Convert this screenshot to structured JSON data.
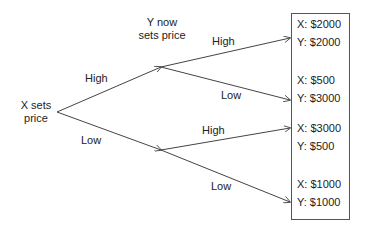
{
  "diagram": {
    "type": "game-tree",
    "root": {
      "label_line1": "X sets",
      "label_line2": "price"
    },
    "second_mover": {
      "label_line1": "Y now",
      "label_line2": "sets price"
    },
    "x_branches": [
      {
        "label": "High"
      },
      {
        "label": "Low"
      }
    ],
    "y_branches": [
      {
        "label": "High"
      },
      {
        "label": "Low"
      },
      {
        "label": "High"
      },
      {
        "label": "Low"
      }
    ],
    "payoffs": [
      {
        "x": "X: $2000",
        "y": "Y: $2000"
      },
      {
        "x": "X: $500",
        "y": "Y: $3000"
      },
      {
        "x": "X: $3000",
        "y": "Y: $500"
      },
      {
        "x": "X: $1000",
        "y": "Y: $1000"
      }
    ],
    "colors": {
      "line": "#444444",
      "text": "#222222",
      "background": "#ffffff"
    }
  }
}
